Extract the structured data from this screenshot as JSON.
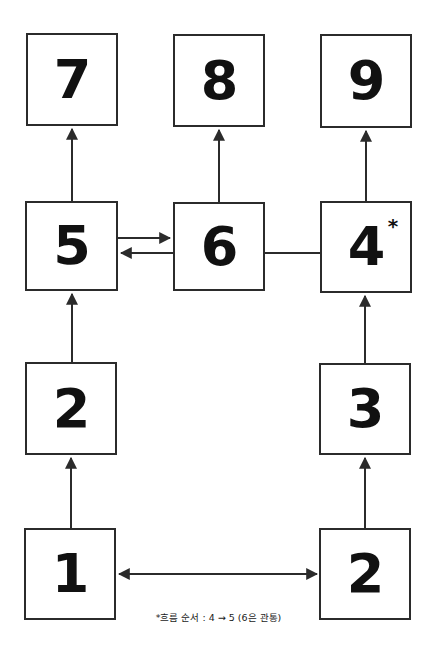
{
  "diagram": {
    "canvas": {
      "width": 437,
      "height": 654,
      "background": "#ffffff"
    },
    "colors": {
      "box_border": "#2b2b2b",
      "box_fill": "#ffffff",
      "text": "#111111",
      "edge": "#2b2b2b"
    },
    "nodes": [
      {
        "id": "n7",
        "label": "7",
        "sup": "",
        "x": 26,
        "y": 33,
        "w": 92,
        "h": 93
      },
      {
        "id": "n8",
        "label": "8",
        "sup": "",
        "x": 173,
        "y": 34,
        "w": 92,
        "h": 93
      },
      {
        "id": "n9",
        "label": "9",
        "sup": "",
        "x": 320,
        "y": 34,
        "w": 92,
        "h": 94
      },
      {
        "id": "n5",
        "label": "5",
        "sup": "",
        "x": 25,
        "y": 201,
        "w": 93,
        "h": 90
      },
      {
        "id": "n6",
        "label": "6",
        "sup": "",
        "x": 173,
        "y": 202,
        "w": 92,
        "h": 89
      },
      {
        "id": "n4",
        "label": "4",
        "sup": "*",
        "x": 320,
        "y": 201,
        "w": 92,
        "h": 92
      },
      {
        "id": "n2a",
        "label": "2",
        "sup": "",
        "x": 25,
        "y": 362,
        "w": 92,
        "h": 93
      },
      {
        "id": "n3",
        "label": "3",
        "sup": "",
        "x": 319,
        "y": 363,
        "w": 92,
        "h": 92
      },
      {
        "id": "n1",
        "label": "1",
        "sup": "",
        "x": 24,
        "y": 528,
        "w": 92,
        "h": 92
      },
      {
        "id": "n2b",
        "label": "2",
        "sup": "",
        "x": 319,
        "y": 528,
        "w": 92,
        "h": 92
      }
    ],
    "edges": [
      {
        "id": "e-5-7",
        "from": "n5",
        "to": "n7",
        "direction": "up",
        "arrows": "end"
      },
      {
        "id": "e-6-8",
        "from": "n6",
        "to": "n8",
        "direction": "up",
        "arrows": "end"
      },
      {
        "id": "e-4-9",
        "from": "n4",
        "to": "n9",
        "direction": "up",
        "arrows": "end"
      },
      {
        "id": "e-5-6a",
        "from": "n5",
        "to": "n6",
        "direction": "right",
        "arrows": "end"
      },
      {
        "id": "e-6-5b",
        "from": "n6",
        "to": "n5",
        "direction": "left",
        "arrows": "end"
      },
      {
        "id": "e-6-4",
        "from": "n6",
        "to": "n4",
        "direction": "right",
        "arrows": "none"
      },
      {
        "id": "e-2a-5",
        "from": "n2a",
        "to": "n5",
        "direction": "up",
        "arrows": "end"
      },
      {
        "id": "e-3-4",
        "from": "n3",
        "to": "n4",
        "direction": "up",
        "arrows": "end"
      },
      {
        "id": "e-1-2a",
        "from": "n1",
        "to": "n2a",
        "direction": "up",
        "arrows": "end"
      },
      {
        "id": "e-2b-3",
        "from": "n2b",
        "to": "n3",
        "direction": "up",
        "arrows": "end"
      },
      {
        "id": "e-1-2b",
        "from": "n1",
        "to": "n2b",
        "direction": "horizontal",
        "arrows": "both"
      }
    ],
    "footnote": {
      "text": "*흐름 순서 : 4 → 5 (6은 관통)",
      "x": 0,
      "y": 610
    }
  }
}
